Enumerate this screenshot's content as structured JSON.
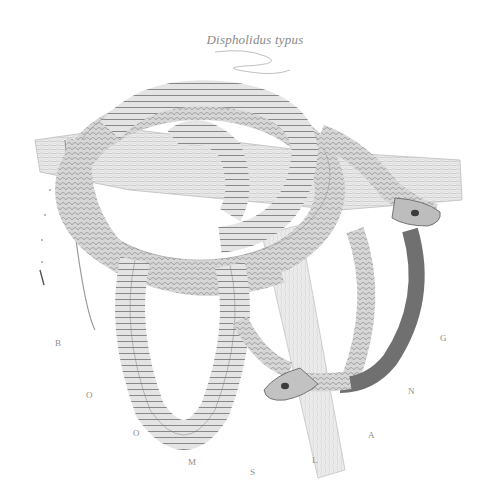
{
  "plate": {
    "title": "Dispholidus typus",
    "common_name_letters": [
      "B",
      "O",
      "O",
      "M",
      "S",
      "L",
      "A",
      "N",
      "G"
    ],
    "subject": "Two boomslang snakes coiled around a tree branch",
    "style": "monochrome pencil engraving"
  },
  "colors": {
    "paper": "#ffffff",
    "ink_dark": "#4a4a4a",
    "ink_mid": "#8a8a8a",
    "ink_light": "#c8c8c8"
  }
}
